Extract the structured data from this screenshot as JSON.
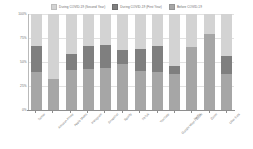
{
  "legend": {
    "position": "top-center",
    "entries": [
      {
        "label": "During COVID-19 (Second Year)",
        "color": "#d3d3d3",
        "icon": "legend-swatch"
      },
      {
        "label": "During COVID-19 (First Year)",
        "color": "#7f7f7f",
        "icon": "legend-swatch"
      },
      {
        "label": "Before COVID-19",
        "color": "#a6a6a6",
        "icon": "legend-swatch"
      }
    ]
  },
  "axes": {
    "y_ticks": [
      "0%",
      "25%",
      "50%",
      "75%",
      "100%"
    ],
    "y_tick_values": [
      0,
      25,
      50,
      75,
      100
    ]
  },
  "chart_data": {
    "type": "bar",
    "title": "",
    "xlabel": "",
    "ylabel": "",
    "ylim": [
      0,
      100
    ],
    "grid": true,
    "stacked": true,
    "stack_total": 100,
    "legend_position": "top-center",
    "categories": [
      "Twitter",
      "Amazon Prime",
      "Apple Music",
      "Instagram",
      "Snapchat",
      "Spotify",
      "TikTok",
      "YouTube",
      "Google Meet / Zoom",
      "Netflix",
      "Zoom",
      "Uber Eats"
    ],
    "series": [
      {
        "name": "Before COVID-19",
        "color": "#a6a6a6",
        "values": [
          67,
          32,
          58,
          67,
          68,
          62,
          64,
          67,
          46,
          66,
          79,
          56
        ]
      },
      {
        "name": "During COVID-19 (First Year)",
        "color": "#7f7f7f",
        "values": [
          0,
          0,
          0,
          0,
          0,
          0,
          0,
          0,
          0,
          0,
          0,
          0
        ]
      },
      {
        "name": "During COVID-19 (Second Year)",
        "color": "#d3d3d3",
        "values": [
          33,
          68,
          42,
          33,
          32,
          38,
          36,
          33,
          54,
          34,
          21,
          44
        ]
      }
    ],
    "bars": [
      {
        "category": "Twitter",
        "before": 40,
        "first_year": 27,
        "second_year": 33
      },
      {
        "category": "Amazon Prime",
        "before": 32,
        "first_year": 0,
        "second_year": 68
      },
      {
        "category": "Apple Music",
        "before": 42,
        "first_year": 16,
        "second_year": 42
      },
      {
        "category": "Instagram",
        "before": 43,
        "first_year": 24,
        "second_year": 33
      },
      {
        "category": "Snapchat",
        "before": 44,
        "first_year": 24,
        "second_year": 32
      },
      {
        "category": "Spotify",
        "before": 48,
        "first_year": 14,
        "second_year": 38
      },
      {
        "category": "TikTok",
        "before": 41,
        "first_year": 23,
        "second_year": 36
      },
      {
        "category": "YouTube",
        "before": 40,
        "first_year": 27,
        "second_year": 33
      },
      {
        "category": "Google Meet / Zoom",
        "before": 38,
        "first_year": 8,
        "second_year": 54
      },
      {
        "category": "Netflix",
        "before": 66,
        "first_year": 0,
        "second_year": 34
      },
      {
        "category": "Zoom",
        "before": 79,
        "first_year": 0,
        "second_year": 21
      },
      {
        "category": "Uber Eats",
        "before": 38,
        "first_year": 18,
        "second_year": 44
      }
    ]
  }
}
